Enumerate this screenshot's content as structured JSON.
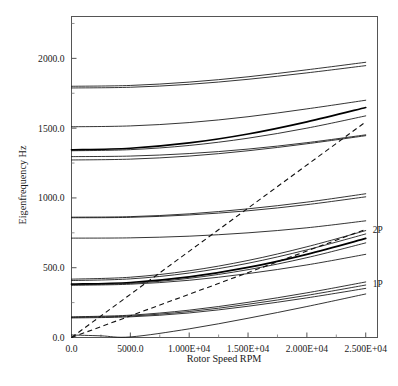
{
  "chart_data": {
    "type": "line",
    "title": "",
    "xlabel": "Rotor Speed RPM",
    "ylabel": "Eigenfrequency Hz",
    "xlim": [
      0,
      26000
    ],
    "ylim": [
      0,
      2300
    ],
    "grid": false,
    "legend_position": "inline-right",
    "xticklabels": [
      "0.0",
      "5000.0",
      "1.000E+04",
      "1.500E+04",
      "2.000E+04",
      "2.500E+04"
    ],
    "xtickvalues": [
      0,
      5000,
      10000,
      15000,
      20000,
      25000
    ],
    "xminorticks": [
      2500,
      7500,
      12500,
      17500,
      22500
    ],
    "yticklabels": [
      "0.0",
      "500.0",
      "1000.0",
      "1500.0",
      "2000.0"
    ],
    "ytickvalues": [
      0,
      500,
      1000,
      1500,
      2000
    ],
    "yminorticks": [
      250,
      750,
      1250,
      1750,
      2250
    ],
    "annotations": [
      {
        "text": "2P",
        "x": 25600,
        "y": 775
      },
      {
        "text": "1P",
        "x": 25600,
        "y": 388
      }
    ],
    "series": [
      {
        "name": "mode-16",
        "style": "solid",
        "x": [
          0,
          5000,
          10000,
          15000,
          20000,
          25000
        ],
        "values": [
          1800,
          1806,
          1830,
          1868,
          1918,
          1972
        ]
      },
      {
        "name": "mode-15",
        "style": "solid",
        "x": [
          0,
          5000,
          10000,
          15000,
          20000,
          25000
        ],
        "values": [
          1788,
          1793,
          1814,
          1850,
          1896,
          1948
        ]
      },
      {
        "name": "mode-14",
        "style": "solid",
        "x": [
          0,
          5000,
          10000,
          15000,
          20000,
          25000
        ],
        "values": [
          1510,
          1516,
          1540,
          1582,
          1638,
          1700
        ]
      },
      {
        "name": "mode-13",
        "style": "bold",
        "x": [
          0,
          5000,
          10000,
          15000,
          20000,
          25000
        ],
        "values": [
          1345,
          1356,
          1394,
          1458,
          1545,
          1648
        ]
      },
      {
        "name": "mode-12",
        "style": "solid",
        "x": [
          0,
          5000,
          10000,
          15000,
          20000,
          25000
        ],
        "values": [
          1338,
          1346,
          1376,
          1428,
          1500,
          1588
        ]
      },
      {
        "name": "mode-11",
        "style": "solid",
        "x": [
          0,
          5000,
          10000,
          15000,
          20000,
          25000
        ],
        "values": [
          1296,
          1300,
          1318,
          1350,
          1396,
          1452
        ]
      },
      {
        "name": "mode-10",
        "style": "solid",
        "x": [
          0,
          5000,
          10000,
          15000,
          20000,
          25000
        ],
        "values": [
          1272,
          1278,
          1300,
          1338,
          1388,
          1446
        ]
      },
      {
        "name": "mode-9",
        "style": "solid",
        "x": [
          0,
          5000,
          10000,
          15000,
          20000,
          25000
        ],
        "values": [
          862,
          866,
          886,
          922,
          970,
          1030
        ]
      },
      {
        "name": "mode-8",
        "style": "solid",
        "x": [
          0,
          5000,
          10000,
          15000,
          20000,
          25000
        ],
        "values": [
          858,
          861,
          878,
          908,
          952,
          1008
        ]
      },
      {
        "name": "mode-7",
        "style": "solid",
        "x": [
          0,
          5000,
          10000,
          15000,
          20000,
          25000
        ],
        "values": [
          712,
          714,
          726,
          750,
          786,
          836
        ]
      },
      {
        "name": "mode-6",
        "style": "solid",
        "x": [
          0,
          5000,
          10000,
          15000,
          20000,
          25000
        ],
        "values": [
          418,
          432,
          478,
          552,
          650,
          766
        ]
      },
      {
        "name": "mode-5",
        "style": "solid",
        "x": [
          0,
          5000,
          10000,
          15000,
          20000,
          25000
        ],
        "values": [
          408,
          420,
          462,
          532,
          628,
          742
        ]
      },
      {
        "name": "mode-4",
        "style": "bold",
        "x": [
          0,
          5000,
          10000,
          15000,
          20000,
          25000
        ],
        "values": [
          382,
          394,
          434,
          502,
          596,
          710
        ]
      },
      {
        "name": "mode-3",
        "style": "solid",
        "x": [
          0,
          5000,
          10000,
          15000,
          20000,
          25000
        ],
        "values": [
          378,
          388,
          424,
          486,
          572,
          678
        ]
      },
      {
        "name": "mode-2",
        "style": "solid",
        "x": [
          0,
          5000,
          10000,
          15000,
          20000,
          25000
        ],
        "values": [
          374,
          382,
          410,
          458,
          520,
          596
        ]
      },
      {
        "name": "mode-1",
        "style": "solid",
        "x": [
          0,
          5000,
          10000,
          15000,
          20000,
          25000
        ],
        "values": [
          148,
          160,
          196,
          252,
          320,
          398
        ]
      },
      {
        "name": "mode-0",
        "style": "solid",
        "x": [
          0,
          5000,
          10000,
          15000,
          20000,
          25000
        ],
        "values": [
          144,
          154,
          186,
          238,
          302,
          376
        ]
      },
      {
        "name": "mode-rigid-b",
        "style": "solid",
        "x": [
          0,
          5000,
          10000,
          15000,
          20000,
          25000
        ],
        "values": [
          140,
          148,
          176,
          224,
          284,
          352
        ]
      },
      {
        "name": "mode-rigid-a",
        "style": "solid",
        "x": [
          0,
          2500,
          5000,
          10000,
          15000,
          20000,
          25000
        ],
        "values": [
          18,
          12,
          4,
          62,
          138,
          222,
          312
        ]
      },
      {
        "name": "excitation-2P",
        "style": "dashed",
        "x": [
          0,
          25000
        ],
        "values": [
          0,
          1545
        ]
      },
      {
        "name": "excitation-1P",
        "style": "dashed",
        "x": [
          0,
          25000
        ],
        "values": [
          0,
          775
        ]
      }
    ]
  }
}
